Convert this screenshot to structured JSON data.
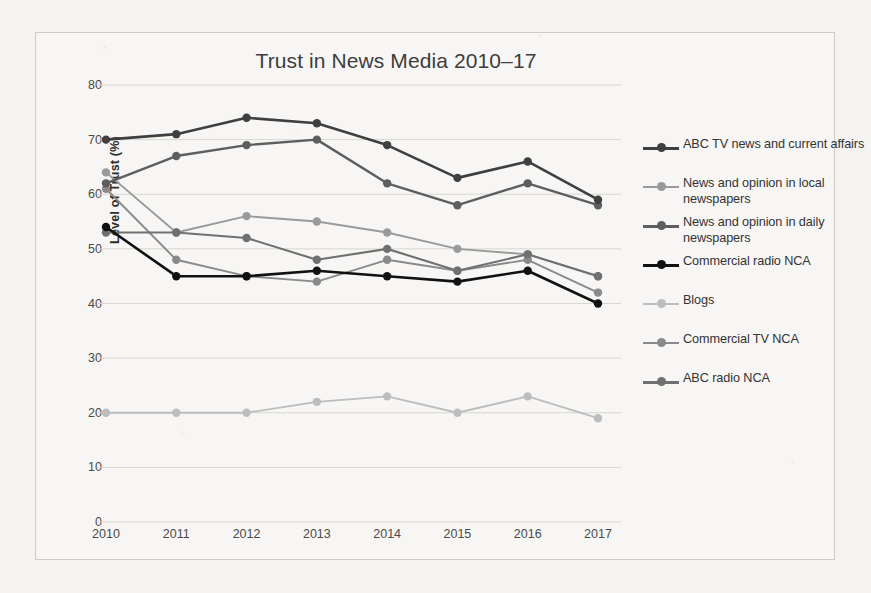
{
  "chart_data": {
    "type": "line",
    "title": "Trust in News Media 2010–17",
    "xlabel": "",
    "ylabel": "Level of Trust (%)",
    "x": [
      "2010",
      "2011",
      "2012",
      "2013",
      "2014",
      "2015",
      "2016",
      "2017"
    ],
    "categories": [
      "2010",
      "2011",
      "2012",
      "2013",
      "2014",
      "2015",
      "2016",
      "2017"
    ],
    "ylim": [
      0,
      80
    ],
    "yticks": [
      0,
      10,
      20,
      30,
      40,
      50,
      60,
      70,
      80
    ],
    "ytick_labels": [
      "0",
      "10",
      "20",
      "30",
      "40",
      "50",
      "60",
      "70",
      "80"
    ],
    "grid": "horizontal",
    "legend_position": "right",
    "series": [
      {
        "name": "ABC TV news and current affairs",
        "color": "#3f3f3f",
        "values": [
          70,
          71,
          74,
          73,
          69,
          63,
          66,
          59
        ]
      },
      {
        "name": "News and opinion in local newspapers",
        "color": "#9a9a9a",
        "values": [
          64,
          53,
          56,
          55,
          53,
          50,
          49,
          45
        ]
      },
      {
        "name": "News and opinion in daily newspapers",
        "color": "#5e5e5e",
        "values": [
          62,
          67,
          69,
          70,
          62,
          58,
          62,
          58
        ]
      },
      {
        "name": "Commercial radio NCA",
        "color": "#111111",
        "values": [
          54,
          45,
          45,
          46,
          45,
          44,
          46,
          40
        ]
      },
      {
        "name": "Blogs",
        "color": "#bdbdbd",
        "values": [
          20,
          20,
          20,
          22,
          23,
          20,
          23,
          19
        ]
      },
      {
        "name": "Commercial TV NCA",
        "color": "#8a8a8a",
        "values": [
          61,
          48,
          45,
          44,
          48,
          46,
          48,
          42
        ]
      },
      {
        "name": "ABC radio NCA",
        "color": "#707070",
        "values": [
          53,
          53,
          52,
          48,
          50,
          46,
          49,
          45
        ]
      }
    ]
  },
  "legend": {
    "items": [
      {
        "label": "ABC TV news and current affairs",
        "color": "#3f3f3f",
        "weight": "3"
      },
      {
        "label": "News and opinion in local newspapers",
        "color": "#9a9a9a",
        "weight": "2"
      },
      {
        "label": "News and opinion in daily newspapers",
        "color": "#5e5e5e",
        "weight": "2.5"
      },
      {
        "label": "Commercial radio NCA",
        "color": "#111111",
        "weight": "3"
      },
      {
        "label": "Blogs",
        "color": "#bdbdbd",
        "weight": "2"
      },
      {
        "label": "Commercial TV NCA",
        "color": "#8a8a8a",
        "weight": "2"
      },
      {
        "label": "ABC radio NCA",
        "color": "#707070",
        "weight": "2.5"
      }
    ]
  }
}
